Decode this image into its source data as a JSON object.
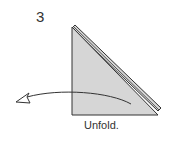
{
  "diagram": {
    "step_number": "3",
    "caption": "Unfold.",
    "colors": {
      "paper": "#d6d6d6",
      "stroke": "#333333"
    },
    "arrow_direction": "left"
  }
}
